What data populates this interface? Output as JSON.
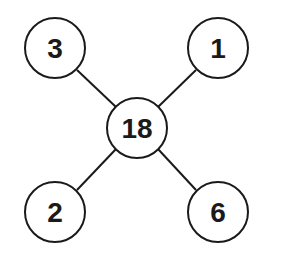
{
  "diagram": {
    "center": {
      "label": "18",
      "cx": 137,
      "cy": 128,
      "r": 30
    },
    "nodes": [
      {
        "id": "top-left",
        "label": "3",
        "cx": 55,
        "cy": 48,
        "r": 30
      },
      {
        "id": "top-right",
        "label": "1",
        "cx": 218,
        "cy": 48,
        "r": 30
      },
      {
        "id": "bottom-left",
        "label": "2",
        "cx": 55,
        "cy": 212,
        "r": 30
      },
      {
        "id": "bottom-right",
        "label": "6",
        "cx": 218,
        "cy": 212,
        "r": 30
      }
    ],
    "stroke_color": "#1a1a1a"
  }
}
